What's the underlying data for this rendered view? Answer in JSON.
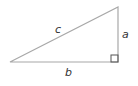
{
  "diagram": {
    "type": "right-triangle",
    "labels": {
      "hypotenuse": "c",
      "vertical_leg": "a",
      "horizontal_leg": "b"
    },
    "colors": {
      "line": "#aaaaaa",
      "text": "#333333"
    }
  }
}
